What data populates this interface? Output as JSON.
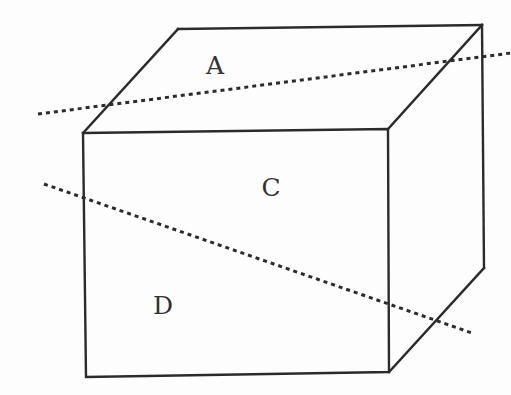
{
  "figure": {
    "type": "cube-perspective-diagram",
    "colors": {
      "line": "#2b2b2b",
      "background": "#fdfdfd",
      "label": "#333333"
    },
    "labels": [
      {
        "id": "A",
        "text": "A",
        "face": "top",
        "x": 215,
        "y": 65
      },
      {
        "id": "C",
        "text": "C",
        "face": "front-upper",
        "x": 271,
        "y": 187
      },
      {
        "id": "D",
        "text": "D",
        "face": "front-lower",
        "x": 163,
        "y": 305
      }
    ],
    "cube": {
      "front_face": {
        "top_left": [
          83,
          133
        ],
        "top_right": [
          388,
          129
        ],
        "bottom_right": [
          389,
          372
        ],
        "bottom_left": [
          86,
          377
        ]
      },
      "back_top_left": [
        178,
        29
      ],
      "back_top_right": [
        482,
        25
      ],
      "back_bottom_right": [
        484,
        268
      ]
    },
    "dotted_lines": [
      {
        "id": "cutting-line-1",
        "from": [
          38,
          114
        ],
        "to": [
          511,
          53
        ]
      },
      {
        "id": "cutting-line-2",
        "from": [
          44,
          184
        ],
        "to": [
          472,
          333
        ]
      }
    ]
  }
}
